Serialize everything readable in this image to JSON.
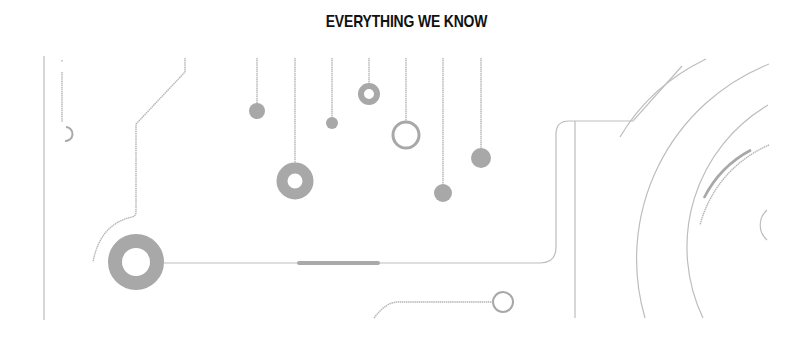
{
  "header": {
    "title": "EVERYTHING WE KNOW"
  },
  "illustration": {
    "description": "circuit-board-decoration",
    "line_color": "#bdbdbd",
    "node_color": "#a8a8a8"
  }
}
